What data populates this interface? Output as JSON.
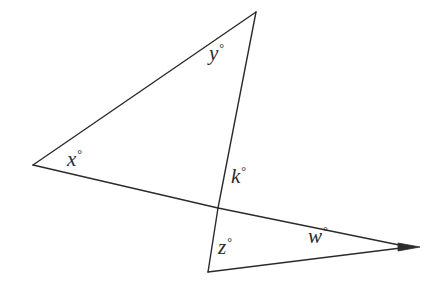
{
  "figure": {
    "name": "two-triangle-angle-diagram",
    "background_color": "#ffffff",
    "stroke_color": "#2b2b2b",
    "stroke_width": 1.4,
    "width": 429,
    "height": 293
  },
  "labels": {
    "x": {
      "symbol": "x",
      "degree": "°",
      "text": "x°"
    },
    "y": {
      "symbol": "y",
      "degree": "°",
      "text": "y°"
    },
    "k": {
      "symbol": "k",
      "degree": "°",
      "text": "k°"
    },
    "z": {
      "symbol": "z",
      "degree": "°",
      "text": "z°"
    },
    "w": {
      "symbol": "w",
      "degree": "°",
      "text": "w°"
    }
  },
  "points": {
    "apex_top": {
      "x": 256,
      "y": 12,
      "name": "apex-top-vertex"
    },
    "left_vertex": {
      "x": 33,
      "y": 165,
      "name": "left-vertex"
    },
    "intersection": {
      "x": 218,
      "y": 208,
      "name": "intersection-point"
    },
    "bottom_vertex": {
      "x": 208,
      "y": 272,
      "name": "bottom-left-vertex"
    },
    "right_tip": {
      "x": 409,
      "y": 247,
      "name": "right-arrow-tip"
    }
  },
  "segments": [
    {
      "name": "edge-left-to-apex",
      "from": "left_vertex",
      "to": "apex_top"
    },
    {
      "name": "edge-apex-to-bottom-vertex",
      "from": "apex_top",
      "to": "bottom_vertex"
    },
    {
      "name": "edge-left-to-right-tip",
      "from": "left_vertex",
      "to": "right_tip"
    },
    {
      "name": "edge-bottom-to-right-tip",
      "from": "bottom_vertex",
      "to": "right_tip"
    }
  ]
}
